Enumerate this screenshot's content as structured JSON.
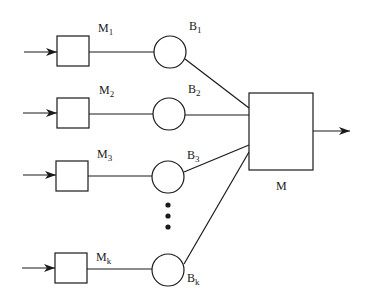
{
  "diagram": {
    "type": "parallel machines with buffers feeding an assembly machine",
    "stations": [
      {
        "machine_label": "M",
        "machine_sub": "1",
        "buffer_label": "B",
        "buffer_sub": "1",
        "y": 52
      },
      {
        "machine_label": "M",
        "machine_sub": "2",
        "buffer_label": "B",
        "buffer_sub": "2",
        "y": 114
      },
      {
        "machine_label": "M",
        "machine_sub": "3",
        "buffer_label": "B",
        "buffer_sub": "3",
        "y": 177
      },
      {
        "machine_label": "M",
        "machine_sub": "k",
        "buffer_label": "B",
        "buffer_sub": "k",
        "y": 269
      }
    ],
    "ellipsis": "⋮",
    "assembly_machine": {
      "label": "M"
    },
    "colors": {
      "stroke": "#1a1a1a",
      "background": "#ffffff"
    }
  }
}
